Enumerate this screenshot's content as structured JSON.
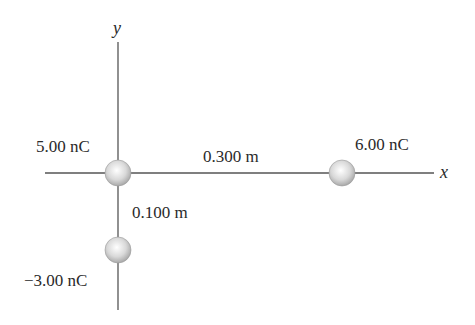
{
  "diagram": {
    "axes": {
      "x_label": "x",
      "y_label": "y",
      "axis_color": "#555555"
    },
    "charges": [
      {
        "label": "5.00 nC",
        "position": "origin"
      },
      {
        "label": "6.00 nC",
        "position": "on x-axis, 0.300 m right of origin"
      },
      {
        "label": "−3.00 nC",
        "position": "on y-axis, 0.100 m below origin"
      }
    ],
    "distances": [
      {
        "label": "0.300 m",
        "between": "5.00 nC and 6.00 nC"
      },
      {
        "label": "0.100 m",
        "between": "5.00 nC and -3.00 nC"
      }
    ],
    "sphere_color": "#d8d8d8"
  }
}
